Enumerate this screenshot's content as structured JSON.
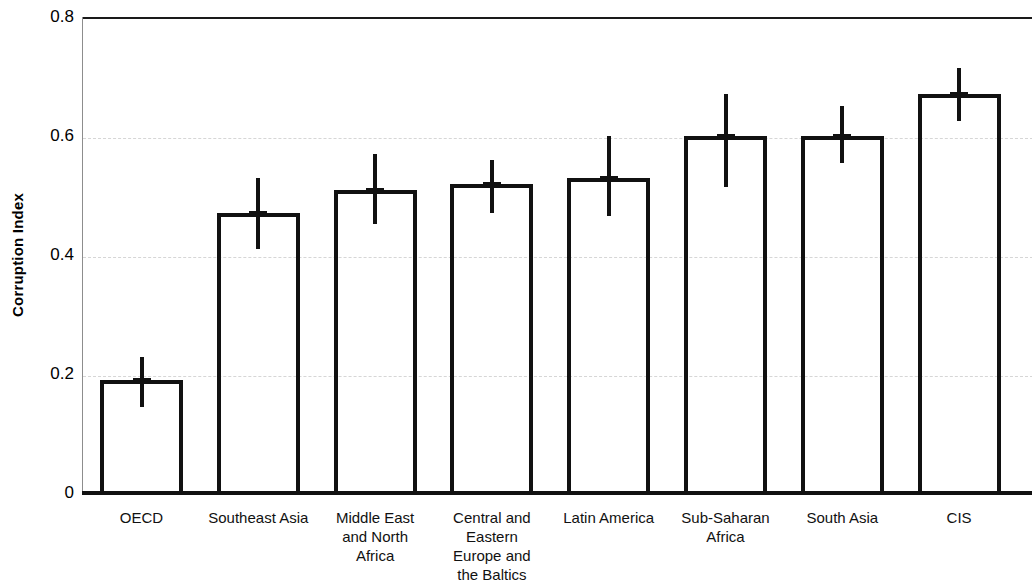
{
  "chart_data": {
    "type": "bar",
    "title": "",
    "subtitle": "",
    "xlabel": "",
    "ylabel": "Corruption Index",
    "ylim": [
      0,
      0.8
    ],
    "yticks": [
      "0",
      "0.2",
      "0.4",
      "0.6",
      "0.8"
    ],
    "ytick_values": [
      0,
      0.2,
      0.4,
      0.6,
      0.8
    ],
    "grid": "horizontal-dashed-light",
    "legend": "none",
    "orientation": "vertical",
    "error_bars": "vertical-with-caps",
    "categories": [
      "OECD",
      "Southeast Asia",
      "Middle East and North Africa",
      "Central and Eastern Europe and the Baltics",
      "Latin America",
      "Sub-Saharan Africa",
      "South Asia",
      "CIS"
    ],
    "values": [
      0.19,
      0.47,
      0.51,
      0.52,
      0.53,
      0.6,
      0.6,
      0.67
    ],
    "err_low": [
      0.145,
      0.41,
      0.452,
      0.47,
      0.465,
      0.515,
      0.555,
      0.625
    ],
    "err_high": [
      0.228,
      0.53,
      0.57,
      0.56,
      0.6,
      0.67,
      0.65,
      0.715
    ]
  },
  "axis": {
    "y_title": "Corruption Index",
    "y_ticks": [
      {
        "label": "0.8",
        "value": 0.8
      },
      {
        "label": "0.6",
        "value": 0.6
      },
      {
        "label": "0.4",
        "value": 0.4
      },
      {
        "label": "0.2",
        "value": 0.2
      },
      {
        "label": "0",
        "value": 0
      }
    ]
  },
  "x_labels": [
    {
      "lines": [
        "OECD"
      ]
    },
    {
      "lines": [
        "Southeast Asia"
      ]
    },
    {
      "lines": [
        "Middle East",
        "and North",
        "Africa"
      ]
    },
    {
      "lines": [
        "Central and",
        "Eastern",
        "Europe and",
        "the Baltics"
      ]
    },
    {
      "lines": [
        "Latin America"
      ]
    },
    {
      "lines": [
        "Sub-Saharan",
        "Africa"
      ]
    },
    {
      "lines": [
        "South Asia"
      ]
    },
    {
      "lines": [
        "CIS"
      ]
    }
  ],
  "colors": {
    "bar_outline": "#111111",
    "error_bar": "#111111",
    "gridline": "#cfcfcf",
    "axis": "#111111",
    "background": "#ffffff"
  }
}
